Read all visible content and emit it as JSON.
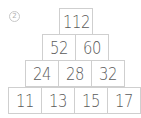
{
  "problem_label": "2",
  "pyramid": {
    "row1": [
      "112"
    ],
    "row2": [
      "52",
      "60"
    ],
    "row3": [
      "24",
      "28",
      "32"
    ],
    "row4": [
      "11",
      "13",
      "15",
      "17"
    ]
  }
}
